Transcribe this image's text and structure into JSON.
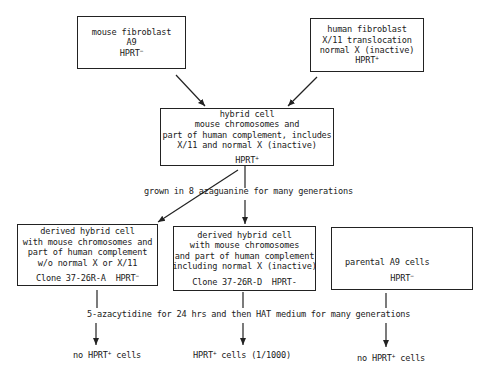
{
  "nodes": {
    "mouse": {
      "lines": [
        "mouse fibroblast",
        "A9"
      ],
      "hprt": "HPRT",
      "hprt_sign": "−"
    },
    "human": {
      "lines": [
        "human fibroblast",
        "X/11 translocation",
        "normal X (inactive)"
      ],
      "hprt": "HPRT",
      "hprt_sign": "+"
    },
    "hybrid": {
      "lines": [
        "hybrid cell",
        "mouse chromosomes and",
        "part of human complement, includes",
        "X/11 and normal X (inactive)"
      ],
      "hprt": "HPRT",
      "hprt_sign": "+"
    },
    "clone_a": {
      "lines": [
        "derived hybrid cell",
        "with mouse chromosomes and",
        "part of human complement",
        "w/o normal X or X/11"
      ],
      "clone": "Clone 37-26R-A",
      "hprt": "HPRT",
      "hprt_sign": "−"
    },
    "clone_d": {
      "lines": [
        "derived hybrid cell",
        "with mouse chromosomes",
        "and part of human complement",
        "including normal X (inactive)"
      ],
      "clone": "Clone 37-26R-D",
      "hprt": "HPRT",
      "hprt_sign": "-"
    },
    "parental": {
      "lines": [
        "parental A9 cells"
      ],
      "hprt": "HPRT",
      "hprt_sign": "−"
    }
  },
  "steps": {
    "azaguanine": "grown in 8 azaguanine for many generations",
    "azacytidine": "5-azacytidine for 24 hrs and then HAT medium for many generations"
  },
  "outcomes": {
    "a": {
      "prefix": "no HPRT",
      "sign": "+",
      "suffix": " cells"
    },
    "d": {
      "prefix": "HPRT",
      "sign": "+",
      "suffix": " cells (1/1000)"
    },
    "parental": {
      "prefix": "no HPRT",
      "sign": "+",
      "suffix": " cells"
    }
  }
}
